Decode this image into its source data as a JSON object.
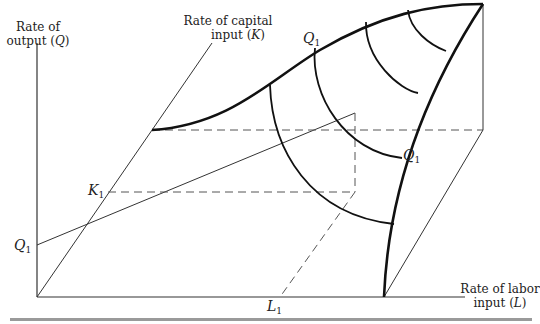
{
  "labels": {
    "output_axis": {
      "line1": "Rate of",
      "line2": "output (",
      "var": "Q",
      "close": ")"
    },
    "capital_axis": {
      "line1": "Rate of capital",
      "line2": "input (",
      "var": "K",
      "close": ")"
    },
    "labor_axis": {
      "line1": "Rate of labor",
      "line2": "input (",
      "var": "L",
      "close": ")"
    },
    "q1_left": {
      "var": "Q",
      "sub": "1"
    },
    "k1": {
      "var": "K",
      "sub": "1"
    },
    "l1": {
      "var": "L",
      "sub": "1"
    },
    "q1_top": {
      "var": "Q",
      "sub": "1"
    },
    "q1_right": {
      "var": "Q",
      "sub": "1"
    }
  },
  "colors": {
    "ink": "#111111",
    "thin": "#333333",
    "dash": "#555555",
    "rule": "#9a9a9a"
  }
}
